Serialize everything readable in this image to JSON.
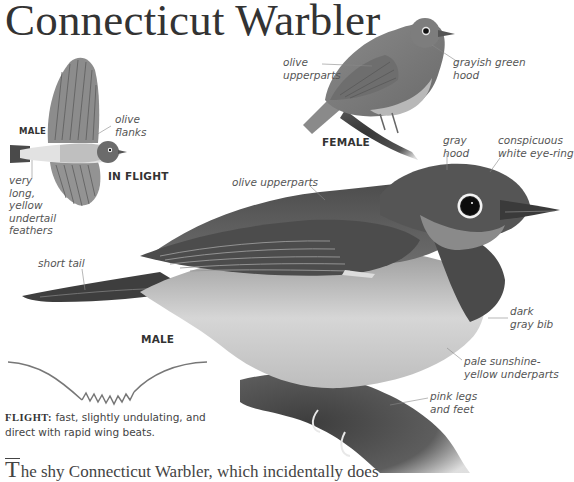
{
  "title": "Connecticut Warbler",
  "flight_bird": {
    "sex_label": "MALE",
    "caption": "IN FLIGHT",
    "labels": {
      "flanks": [
        "olive",
        "flanks"
      ],
      "undertail": [
        "very",
        "long,",
        "yellow",
        "undertail",
        "feathers"
      ]
    }
  },
  "female_bird": {
    "caption": "FEMALE",
    "labels": {
      "upperparts": [
        "olive",
        "upperparts"
      ],
      "hood": [
        "grayish green",
        "hood"
      ]
    }
  },
  "male_bird": {
    "caption": "MALE",
    "labels": {
      "gray_hood": [
        "gray",
        "hood"
      ],
      "eye_ring": [
        "conspicuous",
        "white eye-ring"
      ],
      "upperparts": [
        "olive upperparts"
      ],
      "tail": [
        "short tail"
      ],
      "bib": [
        "dark",
        "gray bib"
      ],
      "underparts": [
        "pale sunshine-",
        "yellow underparts"
      ],
      "legs": [
        "pink legs",
        "and feet"
      ]
    }
  },
  "flight_pattern": {
    "heading": "FLIGHT:",
    "description": "fast, slightly undulating, and direct with rapid wing beats."
  },
  "body_text": {
    "drop_cap": "T",
    "text": "he shy Connecticut Warbler, which incidentally does"
  },
  "colors": {
    "background": "#ffffff",
    "text": "#3a3a3a",
    "label": "#555555",
    "bird_dark": "#3d3d3d",
    "bird_mid": "#7a7a7a",
    "bird_light": "#cfcfcf"
  }
}
